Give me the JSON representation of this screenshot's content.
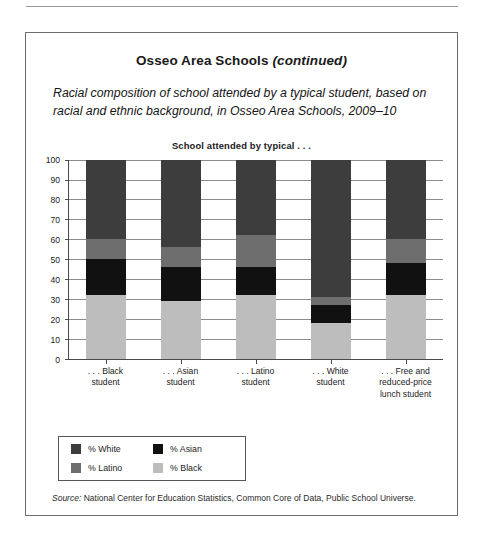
{
  "figure": {
    "title_main": "Osseo Area Schools",
    "title_suffix": "(continued)",
    "subtitle": "Racial composition of school attended by a typical student, based on racial and ethnic background, in Osseo Area Schools, 2009–10",
    "chart_caption": "School attended by typical . . .",
    "source_word": "Source:",
    "source_text": " National Center for Education Statistics, Common Core of Data, Public School Universe."
  },
  "legend": {
    "items": [
      {
        "label": "% White",
        "color": "#3d3d3d"
      },
      {
        "label": "% Asian",
        "color": "#111111"
      },
      {
        "label": "% Latino",
        "color": "#6e6e6e"
      },
      {
        "label": "% Black",
        "color": "#bdbdbd"
      }
    ]
  },
  "chart_data": {
    "type": "bar",
    "stacked": true,
    "title": "School attended by typical . . .",
    "xlabel": "",
    "ylabel": "",
    "ylim": [
      0,
      100
    ],
    "yticks": [
      0,
      10,
      20,
      30,
      40,
      50,
      60,
      70,
      80,
      90,
      100
    ],
    "grid": true,
    "legend_position": "below-left",
    "categories": [
      ". . . Black student",
      ". . . Asian student",
      ". . . Latino student",
      ". . . White student",
      ". . . Free and reduced-price lunch student"
    ],
    "category_lines": [
      [
        ". . . Black",
        "student"
      ],
      [
        ". . . Asian",
        "student"
      ],
      [
        ". . . Latino",
        "student"
      ],
      [
        ". . . White",
        "student"
      ],
      [
        ". . . Free and",
        "reduced-price",
        "lunch student"
      ]
    ],
    "series": [
      {
        "name": "% Black",
        "color": "#bdbdbd",
        "values": [
          32,
          29,
          32,
          18,
          32
        ]
      },
      {
        "name": "% Asian",
        "color": "#111111",
        "values": [
          18,
          17,
          14,
          9,
          16
        ]
      },
      {
        "name": "% Latino",
        "color": "#6e6e6e",
        "values": [
          10,
          10,
          16,
          4,
          12
        ]
      },
      {
        "name": "% White",
        "color": "#3d3d3d",
        "values": [
          40,
          44,
          38,
          69,
          40
        ]
      }
    ]
  }
}
